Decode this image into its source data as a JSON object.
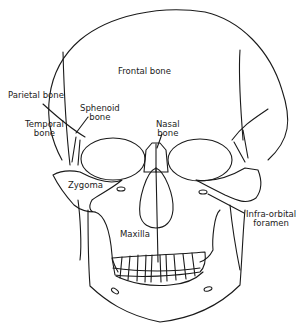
{
  "diagram": {
    "line_color": "#1a1a1a",
    "background": "#ffffff",
    "labels": {
      "frontal": "Frontal bone",
      "parietal": "Parietal bone",
      "sphenoid_1": "Sphenoid",
      "sphenoid_2": "bone",
      "temporal_1": "Temporal",
      "temporal_2": "bone",
      "nasal_1": "Nasal",
      "nasal_2": "bone",
      "zygoma": "Zygoma",
      "maxilla": "Maxilla",
      "infraorbital_1": "Infra-orbital",
      "infraorbital_2": "foramen"
    }
  }
}
